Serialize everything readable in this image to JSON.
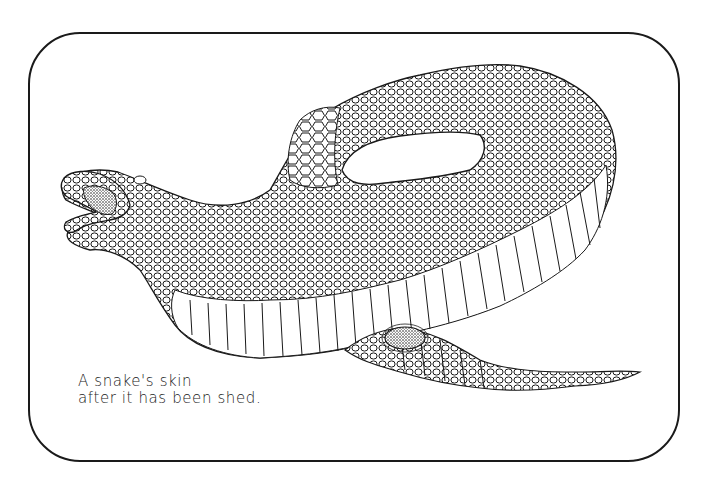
{
  "illustration": {
    "subject": "snake-skin-shed",
    "caption": {
      "line1": "A snake's skin",
      "line2": "after it has been shed."
    },
    "colors": {
      "ink": "#1a1a1a",
      "paper": "#ffffff",
      "stipple": "#333333"
    }
  }
}
